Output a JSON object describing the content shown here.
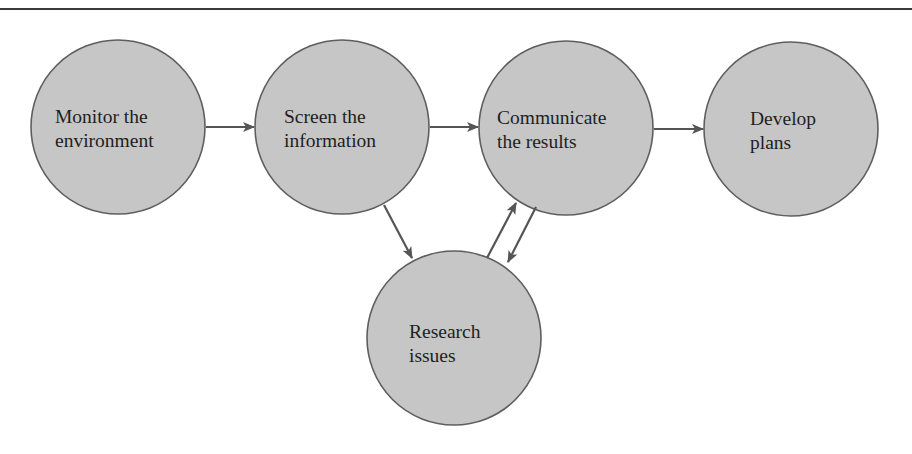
{
  "diagram": {
    "type": "process-flow",
    "style": {
      "node_fill": "#c6c6c6",
      "node_stroke": "#5e5e5e",
      "edge_color": "#555555",
      "text_color": "#1e1e1e",
      "rule_color": "#3a3a3a"
    },
    "nodes": [
      {
        "id": "monitor",
        "lines": [
          "Monitor the",
          "environment"
        ],
        "cx": 118,
        "cy": 127,
        "r": 87
      },
      {
        "id": "screen",
        "lines": [
          "Screen the",
          "information"
        ],
        "cx": 342,
        "cy": 127,
        "r": 87
      },
      {
        "id": "communicate",
        "lines": [
          "Communicate",
          "the results"
        ],
        "cx": 566,
        "cy": 128,
        "r": 87
      },
      {
        "id": "develop",
        "lines": [
          "Develop",
          "plans"
        ],
        "cx": 791,
        "cy": 129,
        "r": 87
      },
      {
        "id": "research",
        "lines": [
          "Research",
          "issues"
        ],
        "cx": 454,
        "cy": 338,
        "r": 87
      }
    ],
    "edges": [
      {
        "from": "monitor",
        "to": "screen"
      },
      {
        "from": "screen",
        "to": "communicate"
      },
      {
        "from": "communicate",
        "to": "develop"
      },
      {
        "from": "screen",
        "to": "research"
      },
      {
        "from": "research",
        "to": "communicate"
      },
      {
        "from": "communicate",
        "to": "research"
      }
    ]
  }
}
